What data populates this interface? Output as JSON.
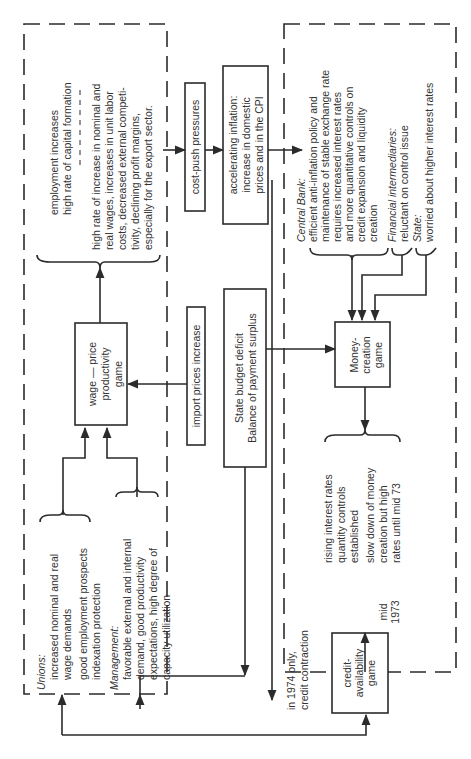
{
  "diagram": {
    "orientation": "rotated 90deg counter-clockwise",
    "left_group": {
      "unions": {
        "heading": "Unions:",
        "lines": [
          "increased nominal and real",
          "wage demands",
          "good employment prospects",
          "indexation protection"
        ]
      },
      "management": {
        "heading": "Management:",
        "lines": [
          "favorable external and internal",
          "demand, good productivity",
          "expectations, high degree of",
          "capacity utilization"
        ]
      },
      "wage_game": {
        "lines": [
          "wage — price",
          "productivity",
          "game"
        ]
      },
      "outcomes_top": {
        "lines": [
          "employment increases",
          "high rate of capital formation"
        ]
      },
      "outcomes_bottom": {
        "lines": [
          "high rate of increase in nominal and",
          "real wages, increases in unit labor",
          "costs, decreased external competi-",
          "tivity, declining profit margins,",
          "especially for the export sector."
        ]
      }
    },
    "middle": {
      "cost_push": "cost-push pressures",
      "inflation": {
        "lines": [
          "accelerating inflation:",
          "increase in domestic",
          "prices and in the CPI"
        ]
      },
      "import_prices": "import prices increase",
      "state_budget": {
        "lines": [
          "State budget deficit",
          "Balance of payment surplus"
        ]
      }
    },
    "right_group": {
      "central_bank": {
        "heading": "Central Bank:",
        "lines": [
          "efficient anti-inflation policy and",
          "maintenance of stable exchange rate",
          "requires increased interest rates",
          "and more quantitative controls on",
          "credit expansion and liquidity",
          "creation"
        ]
      },
      "financial_intermediaries": {
        "heading": "Financial intermediaries:",
        "lines": [
          "reluctant on control issue"
        ]
      },
      "state": {
        "heading": "State:",
        "lines": [
          "worried about higher interest rates"
        ]
      },
      "money_game": {
        "lines": [
          "Money-",
          "creation",
          "game"
        ]
      },
      "money_outcomes": {
        "lines": [
          "rising interest rates",
          "quantity controls",
          "established",
          "slow down of money",
          "creation but high",
          "rates until mid 73"
        ]
      }
    },
    "bottom": {
      "credit_game": {
        "lines": [
          "credit-",
          "availability",
          "game"
        ]
      },
      "mid_label": [
        "mid",
        "1973"
      ],
      "contraction_label": [
        "in 1974 only,",
        "credit contraction"
      ]
    }
  }
}
